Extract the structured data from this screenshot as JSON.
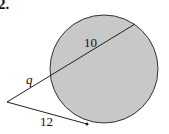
{
  "problem": {
    "number": "2."
  },
  "diagram": {
    "circle": {
      "cx": 104,
      "cy": 69,
      "r": 54,
      "fill": "#c8c8c8",
      "stroke": "#333333"
    },
    "external_point": {
      "x": 7,
      "y": 102
    },
    "secant": {
      "near_intersection": {
        "x": 50,
        "y": 76
      },
      "far_intersection": {
        "x": 135,
        "y": 24
      }
    },
    "tangent_point": {
      "x": 87,
      "y": 124
    },
    "labels": {
      "internal_segment": "10",
      "external_segment": "q",
      "tangent_segment": "12"
    }
  }
}
